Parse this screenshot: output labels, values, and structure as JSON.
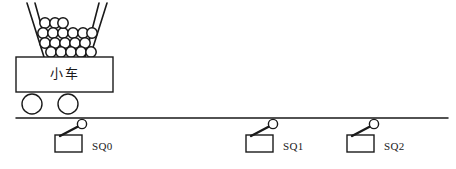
{
  "diagram": {
    "colors": {
      "stroke": "#1a1a1a",
      "fill": "#ffffff",
      "ball_stroke": "#161616"
    },
    "cart": {
      "label": "小车",
      "body": {
        "x": 16,
        "y": 57,
        "width": 97,
        "height": 35
      },
      "wheels": [
        {
          "cx": 32,
          "cy": 104,
          "r": 10
        },
        {
          "cx": 68,
          "cy": 104,
          "r": 10
        }
      ]
    },
    "hopper": {
      "name": "funnel-hopper",
      "left_wall": {
        "x1": 27,
        "y1": 3,
        "x2": 44,
        "y2": 57
      },
      "left_wall_inner": {
        "x1": 35,
        "y1": 3,
        "x2": 50,
        "y2": 57
      },
      "right_wall": {
        "x1": 107,
        "y1": 3,
        "x2": 90,
        "y2": 57
      },
      "right_wall_inner": {
        "x1": 99,
        "y1": 3,
        "x2": 85,
        "y2": 57
      },
      "ball_radius": 5.2,
      "ball_count": 19,
      "balls": [
        {
          "cx": 45,
          "cy": 23
        },
        {
          "cx": 55,
          "cy": 23
        },
        {
          "cx": 43,
          "cy": 33
        },
        {
          "cx": 53,
          "cy": 33
        },
        {
          "cx": 63,
          "cy": 33
        },
        {
          "cx": 73,
          "cy": 33
        },
        {
          "cx": 83,
          "cy": 33
        },
        {
          "cx": 92,
          "cy": 33
        },
        {
          "cx": 45,
          "cy": 43
        },
        {
          "cx": 55,
          "cy": 43
        },
        {
          "cx": 65,
          "cy": 43
        },
        {
          "cx": 75,
          "cy": 43
        },
        {
          "cx": 85,
          "cy": 43
        },
        {
          "cx": 51,
          "cy": 52
        },
        {
          "cx": 61,
          "cy": 52
        },
        {
          "cx": 71,
          "cy": 52
        },
        {
          "cx": 81,
          "cy": 52
        },
        {
          "cx": 91,
          "cy": 52
        },
        {
          "cx": 63,
          "cy": 23
        }
      ]
    },
    "ground": {
      "name": "rail-ground-line",
      "x1": 16,
      "y1": 118,
      "x2": 448,
      "y2": 118
    },
    "switches": [
      {
        "id": "SQ0",
        "label": "SQ0",
        "box": {
          "x": 55,
          "y": 135,
          "width": 27,
          "height": 17
        },
        "lever": {
          "x1": 60,
          "y1": 136,
          "x2": 79,
          "y2": 126
        },
        "roller": {
          "cx": 82,
          "cy": 124,
          "r": 4.6
        },
        "label_pos": {
          "x": 92,
          "y": 150
        }
      },
      {
        "id": "SQ1",
        "label": "SQ1",
        "box": {
          "x": 246,
          "y": 135,
          "width": 27,
          "height": 17
        },
        "lever": {
          "x1": 251,
          "y1": 136,
          "x2": 270,
          "y2": 126
        },
        "roller": {
          "cx": 273,
          "cy": 124,
          "r": 4.6
        },
        "label_pos": {
          "x": 283,
          "y": 150
        }
      },
      {
        "id": "SQ2",
        "label": "SQ2",
        "box": {
          "x": 347,
          "y": 135,
          "width": 27,
          "height": 17
        },
        "lever": {
          "x1": 352,
          "y1": 136,
          "x2": 371,
          "y2": 126
        },
        "roller": {
          "cx": 374,
          "cy": 124,
          "r": 4.6
        },
        "label_pos": {
          "x": 384,
          "y": 150
        }
      }
    ]
  }
}
